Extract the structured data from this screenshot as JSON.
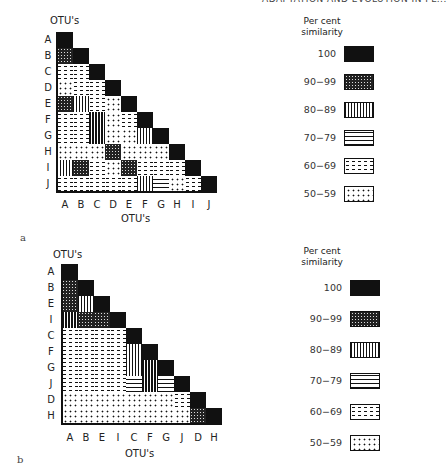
{
  "header": {
    "text": "ADAPTATION AND EVOLUTION IN PL..."
  },
  "patterns": {
    "100": "p100",
    "90-99": "p90",
    "80-89": "p80",
    "70-79": "p70",
    "60-69": "p60",
    "50-59": "p50"
  },
  "panels": [
    {
      "label": "a",
      "y_axis_title": "OTU's",
      "x_axis_title": "OTU's",
      "row_labels": [
        "A",
        "B",
        "C",
        "D",
        "E",
        "F",
        "G",
        "H",
        "I",
        "J"
      ],
      "col_labels": [
        "A",
        "B",
        "C",
        "D",
        "E",
        "F",
        "G",
        "H",
        "I",
        "J"
      ],
      "matrix": [
        [
          "100"
        ],
        [
          "90-99",
          "100"
        ],
        [
          "60-69",
          "60-69",
          "100"
        ],
        [
          "50-59",
          "60-69",
          "60-69",
          "100"
        ],
        [
          "90-99",
          "80-89",
          "60-69",
          "50-59",
          "100"
        ],
        [
          "60-69",
          "60-69",
          "80-89",
          "50-59",
          "60-69",
          "100"
        ],
        [
          "60-69",
          "60-69",
          "80-89",
          "50-59",
          "50-59",
          "80-89",
          "100"
        ],
        [
          "50-59",
          "50-59",
          "50-59",
          "90-99",
          "50-59",
          "50-59",
          "50-59",
          "100"
        ],
        [
          "80-89",
          "90-99",
          "60-69",
          "50-59",
          "90-99",
          "60-69",
          "60-69",
          "60-69",
          "100"
        ],
        [
          "60-69",
          "60-69",
          "60-69",
          "60-69",
          "60-69",
          "80-89",
          "70-79",
          "50-59",
          "60-69",
          "100"
        ]
      ],
      "legend": {
        "title_line1": "Per cent",
        "title_line2": "similarity",
        "items": [
          {
            "label": "100",
            "key": "100"
          },
          {
            "label": "90−99",
            "key": "90-99"
          },
          {
            "label": "80−89",
            "key": "80-89"
          },
          {
            "label": "70−79",
            "key": "70-79"
          },
          {
            "label": "60−69",
            "key": "60-69"
          },
          {
            "label": "50−59",
            "key": "50-59"
          }
        ]
      }
    },
    {
      "label": "b",
      "y_axis_title": "OTU's",
      "x_axis_title": "OTU's",
      "row_labels": [
        "A",
        "B",
        "E",
        "I",
        "C",
        "F",
        "G",
        "J",
        "D",
        "H"
      ],
      "col_labels": [
        "A",
        "B",
        "E",
        "I",
        "C",
        "F",
        "G",
        "J",
        "D",
        "H"
      ],
      "matrix": [
        [
          "100"
        ],
        [
          "90-99",
          "100"
        ],
        [
          "90-99",
          "80-89",
          "100"
        ],
        [
          "80-89",
          "90-99",
          "90-99",
          "100"
        ],
        [
          "60-69",
          "60-69",
          "60-69",
          "60-69",
          "100"
        ],
        [
          "60-69",
          "60-69",
          "60-69",
          "60-69",
          "80-89",
          "100"
        ],
        [
          "60-69",
          "60-69",
          "60-69",
          "60-69",
          "80-89",
          "80-89",
          "100"
        ],
        [
          "60-69",
          "60-69",
          "60-69",
          "60-69",
          "70-79",
          "80-89",
          "70-79",
          "100"
        ],
        [
          "50-59",
          "50-59",
          "50-59",
          "50-59",
          "50-59",
          "50-59",
          "50-59",
          "60-69",
          "100"
        ],
        [
          "50-59",
          "50-59",
          "50-59",
          "50-59",
          "50-59",
          "50-59",
          "50-59",
          "50-59",
          "90-99",
          "100"
        ]
      ],
      "legend": {
        "title_line1": "Per cent",
        "title_line2": "similarity",
        "items": [
          {
            "label": "100",
            "key": "100"
          },
          {
            "label": "90−99",
            "key": "90-99"
          },
          {
            "label": "80−89",
            "key": "80-89"
          },
          {
            "label": "70−79",
            "key": "70-79"
          },
          {
            "label": "60−69",
            "key": "60-69"
          },
          {
            "label": "50−59",
            "key": "50-59"
          }
        ]
      }
    }
  ]
}
